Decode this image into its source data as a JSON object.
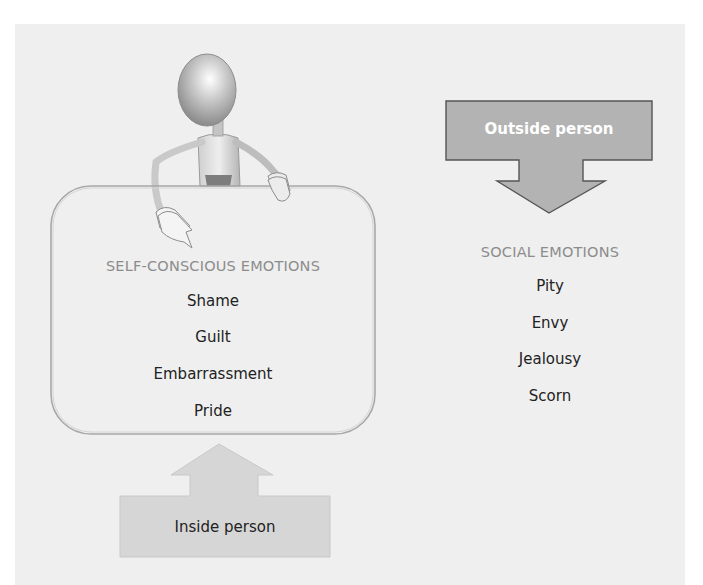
{
  "diagram": {
    "colors": {
      "background": "#efefef",
      "outside_arrow_fill": "#b3b3b3",
      "outside_arrow_stroke": "#555555",
      "inside_arrow_fill": "#d6d6d6",
      "box_stroke": "#a8a8a8",
      "category_text": "#8c8c8c",
      "item_text": "#222222"
    },
    "figure": {
      "icon": "stick-figure-pointing-icon"
    },
    "self_conscious": {
      "heading": "SELF-CONSCIOUS EMOTIONS",
      "items": [
        "Shame",
        "Guilt",
        "Embarrassment",
        "Pride"
      ]
    },
    "social": {
      "heading": "SOCIAL EMOTIONS",
      "items": [
        "Pity",
        "Envy",
        "Jealousy",
        "Scorn"
      ]
    },
    "outside_arrow": {
      "label": "Outside person",
      "direction": "down"
    },
    "inside_arrow": {
      "label": "Inside person",
      "direction": "up"
    }
  }
}
